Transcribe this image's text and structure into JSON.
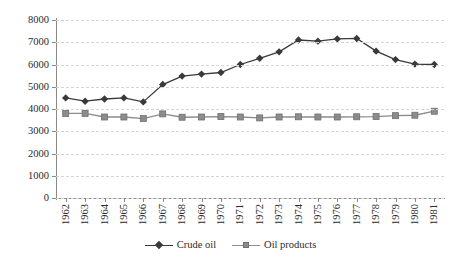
{
  "chart_data": {
    "type": "line",
    "title": "",
    "subtitle": "",
    "xlabel": "",
    "ylabel": "",
    "categories": [
      "1962",
      "1963",
      "1964",
      "1965",
      "1966",
      "1967",
      "1968",
      "1969",
      "1970",
      "1971",
      "1972",
      "1973",
      "1974",
      "1975",
      "1976",
      "1977",
      "1978",
      "1979",
      "1980",
      "1981"
    ],
    "series": [
      {
        "name": "Crude oil",
        "marker": "diamond",
        "color": "#3a3a3a",
        "values": [
          4500,
          4350,
          4450,
          4500,
          4320,
          5100,
          5480,
          5570,
          5640,
          6000,
          6280,
          6570,
          7100,
          7050,
          7150,
          7170,
          6600,
          6220,
          6020,
          6000
        ]
      },
      {
        "name": "Oil products",
        "marker": "square",
        "color": "#8c8c8c",
        "values": [
          3800,
          3800,
          3640,
          3640,
          3570,
          3780,
          3630,
          3640,
          3660,
          3640,
          3600,
          3640,
          3650,
          3640,
          3640,
          3650,
          3660,
          3700,
          3720,
          3900
        ]
      }
    ],
    "ylim": [
      0,
      8000
    ],
    "yticks": [
      0,
      1000,
      2000,
      3000,
      4000,
      5000,
      6000,
      7000,
      8000
    ],
    "ytick_labels": [
      "0",
      "1000",
      "2000",
      "3000",
      "4000",
      "5000",
      "6000",
      "7000",
      "8000"
    ],
    "grid": "horizontal-dashed",
    "legend_position": "bottom-center"
  },
  "colors": {
    "crude_oil": "#3a3a3a",
    "oil_products": "#8c8c8c",
    "axis": "#8a8a8a",
    "gridline": "#d9d4d4",
    "text": "#2b2b2b",
    "background": "#ffffff"
  },
  "legend": {
    "items": [
      {
        "label": "Crude oil",
        "marker": "diamond-marker-icon",
        "color": "#3a3a3a"
      },
      {
        "label": "Oil products",
        "marker": "square-marker-icon",
        "color": "#8c8c8c"
      }
    ]
  }
}
